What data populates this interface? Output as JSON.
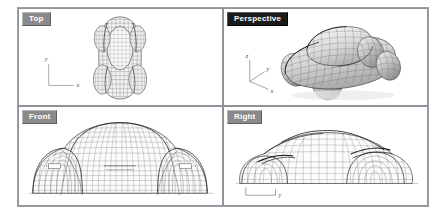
{
  "app": {
    "type": "3d-cad-modeler",
    "layout": "four-viewport",
    "background_color": "#ffffff",
    "frame_border_color": "#9aa0a6"
  },
  "viewports": [
    {
      "id": "top",
      "label": "Top",
      "position": "top-left",
      "active": false,
      "tab_bg": "#8a8a8a",
      "tab_text_color": "#ffffff",
      "display_mode": "wireframe",
      "axes": [
        {
          "name": "y",
          "label": "y",
          "direction": "up"
        },
        {
          "name": "x",
          "label": "x",
          "direction": "right"
        }
      ],
      "model": "car-body-wireframe-plan-view"
    },
    {
      "id": "perspective",
      "label": "Perspective",
      "position": "top-right",
      "active": true,
      "tab_bg": "#1a1a1a",
      "tab_text_color": "#ffffff",
      "display_mode": "shaded-with-wireframe",
      "axes": [
        {
          "name": "z",
          "label": "z",
          "direction": "up"
        },
        {
          "name": "y",
          "label": "y",
          "direction": "left-depth"
        },
        {
          "name": "x",
          "label": "x",
          "direction": "right-down"
        }
      ],
      "model": "car-body-shaded-perspective-view"
    },
    {
      "id": "front",
      "label": "Front",
      "position": "bottom-left",
      "active": false,
      "tab_bg": "#8a8a8a",
      "tab_text_color": "#ffffff",
      "display_mode": "wireframe",
      "axes": [],
      "model": "car-body-wireframe-front-elevation"
    },
    {
      "id": "right",
      "label": "Right",
      "position": "bottom-right",
      "active": false,
      "tab_bg": "#8a8a8a",
      "tab_text_color": "#ffffff",
      "display_mode": "wireframe",
      "axes": [
        {
          "name": "y",
          "label": "y",
          "direction": "right"
        }
      ],
      "model": "car-body-wireframe-side-elevation"
    }
  ],
  "colors": {
    "wireframe_line": "#5a5a5a",
    "wireframe_light": "#9a9a9a",
    "surface_fill_light": "#e8e8e8",
    "surface_fill_mid": "#cfcfcf",
    "surface_fill_dark": "#a8a8a8",
    "highlight_edge": "#1c1c1c",
    "axis_line": "#7a7a7a"
  }
}
